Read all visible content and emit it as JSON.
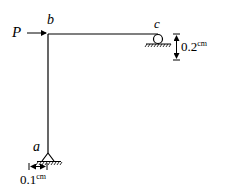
{
  "diagram": {
    "type": "frame-structure",
    "nodes": {
      "a": {
        "label": "a",
        "support": "pin"
      },
      "b": {
        "label": "b",
        "support": "none"
      },
      "c": {
        "label": "c",
        "support": "roller"
      }
    },
    "load": {
      "label": "P",
      "direction": "right",
      "at": "b"
    },
    "dimensions": {
      "settlement_c": {
        "value": "0.2",
        "unit": "cm"
      },
      "displacement_a": {
        "value": "0.1",
        "unit": "cm"
      }
    }
  }
}
